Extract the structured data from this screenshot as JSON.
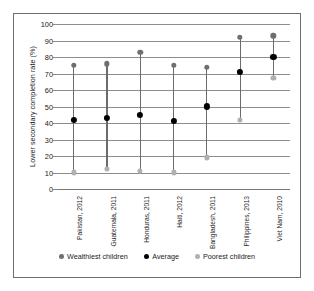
{
  "chart_data": {
    "type": "scatter",
    "title": "",
    "xlabel": "",
    "ylabel": "Lower secondary completion rate (%)",
    "ylim": [
      0,
      100
    ],
    "yticks": [
      0,
      10,
      20,
      30,
      40,
      50,
      60,
      70,
      80,
      90,
      100
    ],
    "grid": true,
    "legend_position": "bottom",
    "categories": [
      "Pakistan, 2012",
      "Guatemala, 2011",
      "Honduras, 2011",
      "Haiti, 2012",
      "Bangladesh, 2011",
      "Philippines, 2013",
      "Viet Nam, 2010"
    ],
    "series": [
      {
        "name": "Wealthiest children",
        "color": "#6f6f6f",
        "values": [
          75,
          76,
          83,
          75,
          74,
          92,
          93
        ]
      },
      {
        "name": "Average",
        "color": "#000000",
        "values": [
          42,
          43,
          45,
          41,
          50,
          71,
          80
        ]
      },
      {
        "name": "Poorest children",
        "color": "#b0b0b0",
        "values": [
          10,
          12,
          11,
          10,
          19,
          42,
          67
        ]
      }
    ]
  },
  "axis": {
    "y_title": "Lower secondary completion rate (%)",
    "ticks": [
      "100",
      "90",
      "80",
      "70",
      "60",
      "50",
      "40",
      "30",
      "20",
      "10",
      "0"
    ]
  },
  "legend": {
    "items": [
      {
        "label": "Wealthiest children",
        "key": "wealthiest"
      },
      {
        "label": "Average",
        "key": "average"
      },
      {
        "label": "Poorest children",
        "key": "poorest"
      }
    ]
  }
}
